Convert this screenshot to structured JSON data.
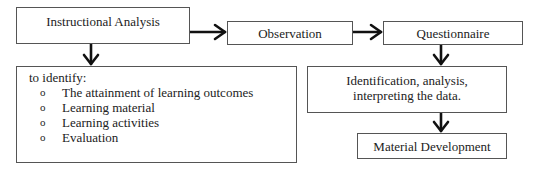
{
  "diagram": {
    "nodes": {
      "instructional_analysis": "Instructional Analysis",
      "observation": "Observation",
      "questionnaire": "Questionnaire",
      "identification": [
        "Identification, analysis,",
        "interpreting the data."
      ],
      "material_development": "Material Development"
    },
    "identify_box": {
      "heading": "to identify:",
      "bullet_glyph": "o",
      "items": [
        "The attainment of learning outcomes",
        "Learning material",
        "Learning activities",
        "Evaluation"
      ]
    },
    "edges": [
      {
        "from": "Instructional Analysis",
        "to": "Observation"
      },
      {
        "from": "Observation",
        "to": "Questionnaire"
      },
      {
        "from": "Instructional Analysis",
        "to": "to identify"
      },
      {
        "from": "Questionnaire",
        "to": "Identification, analysis, interpreting the data."
      },
      {
        "from": "Identification, analysis, interpreting the data.",
        "to": "Material Development"
      }
    ]
  }
}
